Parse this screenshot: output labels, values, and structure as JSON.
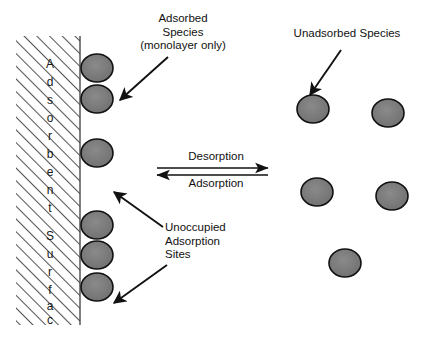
{
  "diagram": {
    "type": "schematic",
    "colors": {
      "particle_fill": "#757575",
      "particle_stroke": "#111111",
      "hatch_line": "#555555",
      "text": "#111111",
      "arrow": "#111111",
      "background": "#ffffff"
    },
    "surface": {
      "vertical_text": "Adsorbent Surface",
      "vertical_letters": [
        "A",
        "d",
        "s",
        "o",
        "r",
        "b",
        "e",
        "n",
        "t",
        "",
        "S",
        "u",
        "r",
        "f",
        "a",
        "c",
        "e"
      ],
      "hatch_pattern": "diagonal-lines",
      "bounds": {
        "x": 16,
        "y": 36,
        "width": 64,
        "height": 289
      }
    },
    "labels": {
      "adsorbed_species": "Adsorbed\nSpecies\n(monolayer only)",
      "unadsorbed_species": "Unadsorbed Species",
      "unoccupied_sites": "Unoccupied\nAdsorption\nSites",
      "desorption": "Desorption",
      "adsorption": "Adsorption"
    },
    "equilibrium": {
      "top_arrow_direction": "right",
      "bottom_arrow_direction": "left",
      "top_label": "Desorption",
      "bottom_label": "Adsorption"
    },
    "adsorbed_particles": [
      {
        "cx": 97,
        "cy": 68,
        "rx": 16,
        "ry": 14
      },
      {
        "cx": 97,
        "cy": 99,
        "rx": 16,
        "ry": 14
      },
      {
        "cx": 97,
        "cy": 153,
        "rx": 16,
        "ry": 14
      },
      {
        "cx": 97,
        "cy": 225,
        "rx": 16,
        "ry": 14
      },
      {
        "cx": 97,
        "cy": 255,
        "rx": 16,
        "ry": 14
      },
      {
        "cx": 97,
        "cy": 287,
        "rx": 16,
        "ry": 14
      }
    ],
    "unadsorbed_particles": [
      {
        "cx": 313,
        "cy": 109,
        "rx": 16,
        "ry": 14
      },
      {
        "cx": 388,
        "cy": 113,
        "rx": 16,
        "ry": 14
      },
      {
        "cx": 317,
        "cy": 192,
        "rx": 16,
        "ry": 14
      },
      {
        "cx": 392,
        "cy": 196,
        "rx": 16,
        "ry": 14
      },
      {
        "cx": 345,
        "cy": 263,
        "rx": 16,
        "ry": 14
      }
    ],
    "pointer_arrows": [
      {
        "name": "adsorbed-species-pointer",
        "x1": 168,
        "y1": 57,
        "x2": 118,
        "y2": 101
      },
      {
        "name": "unadsorbed-species-pointer",
        "x1": 341,
        "y1": 50,
        "x2": 309,
        "y2": 96
      },
      {
        "name": "unoccupied-upper-pointer",
        "x1": 163,
        "y1": 227,
        "x2": 113,
        "y2": 191
      },
      {
        "name": "unoccupied-lower-pointer",
        "x1": 167,
        "y1": 265,
        "x2": 113,
        "y2": 304
      }
    ]
  }
}
